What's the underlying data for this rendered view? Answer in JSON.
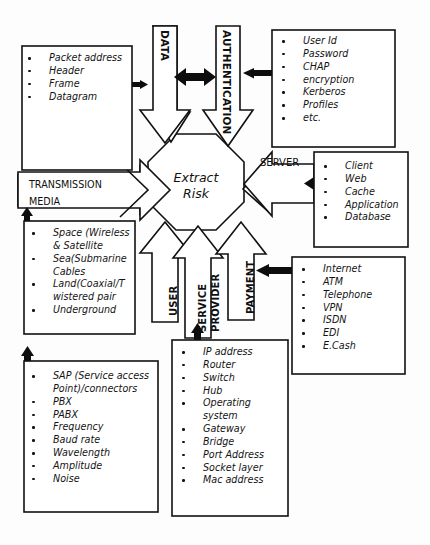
{
  "diagram": {
    "title": "Extract Risk",
    "center_node": {
      "label_line1": "Extract",
      "label_line2": "Risk",
      "shape": "octagon"
    },
    "arrow_labels": {
      "data": "DATA",
      "authentication": "AUTHENTICATION",
      "server": "SERVER",
      "transmission_media_line1": "TRANSMISSION",
      "transmission_media_line2": "MEDIA",
      "user": "USER",
      "service_provider_line1": "SERVICE",
      "service_provider_line2": "PROVIDER",
      "payment": "PAYMENT"
    },
    "boxes": [
      {
        "id": "data-items",
        "items": [
          "Packet\naddress",
          "Header",
          "Frame",
          "Datagram"
        ]
      },
      {
        "id": "authentication-items",
        "items": [
          "User Id",
          "Password",
          "CHAP",
          "encryption",
          "Kerberos",
          "Profiles",
          "etc."
        ]
      },
      {
        "id": "server-items",
        "items": [
          "Client",
          "Web",
          "Cache",
          "Application",
          "Database"
        ]
      },
      {
        "id": "payment-items",
        "items": [
          "Internet",
          "ATM",
          "Telephone",
          "VPN",
          "ISDN",
          "EDI",
          "E.Cash"
        ]
      },
      {
        "id": "transmission-media-items",
        "items": [
          "Space (Wireless\n& Satellite",
          "Sea(Submarine\nCables",
          "Land(Coaxial/T\nwistered pair",
          "Underground"
        ]
      },
      {
        "id": "user-items",
        "items": [
          "SAP (Service access\nPoint)/connectors",
          "PBX",
          "PABX",
          "Frequency",
          "Baud rate",
          "Wavelength",
          "Amplitude",
          "Noise"
        ]
      },
      {
        "id": "service-provider-items",
        "items": [
          "IP address",
          "Router",
          "Switch",
          "Hub",
          "Operating\nsystem",
          "Gateway",
          "Bridge",
          "Port Address",
          "Socket layer",
          "Mac address"
        ]
      }
    ],
    "colors": {
      "stroke": "#111111",
      "fill": "#ffffff",
      "solid_arrow": "#0d0d0d",
      "background": "#fdfdfd",
      "text": "#131313"
    }
  }
}
